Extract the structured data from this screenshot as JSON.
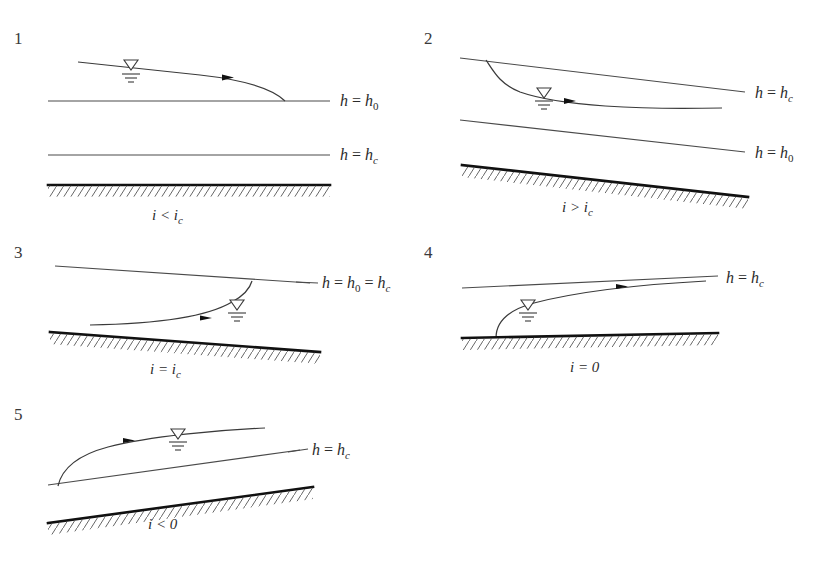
{
  "figure": {
    "background_color": "#ffffff",
    "line_color": "#3a3a3a",
    "bed_color": "#111111",
    "panel_count": 5
  },
  "symbols": {
    "water_level_marker": "water-level-triangle-icon",
    "flow_direction_marker": "flow-direction-arrow-icon",
    "bed_marker": "hatched-channel-bed"
  },
  "panels": [
    {
      "number": "1",
      "slope_condition": "i<i_c",
      "slope_label_parts": {
        "lead": "i",
        "op": "<",
        "sym": "i",
        "sub": "c"
      },
      "bed_type": "mild-slope",
      "labels": [
        {
          "id": "h0",
          "text": "h = h_0",
          "parts": {
            "lhs": "h",
            "op": "=",
            "rhs": "h",
            "sub": "0",
            "sub_kind": "num"
          }
        },
        {
          "id": "hc",
          "text": "h = h_c",
          "parts": {
            "lhs": "h",
            "op": "=",
            "rhs": "h",
            "sub": "c",
            "sub_kind": "italic"
          }
        }
      ],
      "description": "Mild slope, drawdown curve falling to normal depth line"
    },
    {
      "number": "2",
      "slope_condition": "i>i_c",
      "slope_label_parts": {
        "lead": "i",
        "op": ">",
        "sym": "i",
        "sub": "c"
      },
      "bed_type": "steep-slope",
      "labels": [
        {
          "id": "hc",
          "text": "h = h_c",
          "parts": {
            "lhs": "h",
            "op": "=",
            "rhs": "h",
            "sub": "c",
            "sub_kind": "italic"
          }
        },
        {
          "id": "h0",
          "text": "h = h_0",
          "parts": {
            "lhs": "h",
            "op": "=",
            "rhs": "h",
            "sub": "0",
            "sub_kind": "num"
          }
        }
      ],
      "description": "Steep slope, profile descending from critical depth line"
    },
    {
      "number": "3",
      "slope_condition": "i=i_c",
      "slope_label_parts": {
        "lead": "i",
        "op": "=",
        "sym": "i",
        "sub": "c"
      },
      "bed_type": "critical-slope",
      "labels": [
        {
          "id": "h0hc",
          "text": "h = h_0 = h_c",
          "parts": {
            "lhs": "h",
            "op": "=",
            "mid": "h",
            "mid_sub": "0",
            "op2": "=",
            "rhs": "h",
            "sub": "c",
            "sub_kind": "italic"
          }
        }
      ],
      "description": "Critical slope, normal depth equals critical depth"
    },
    {
      "number": "4",
      "slope_condition": "i=0",
      "slope_label_parts": {
        "lead": "i",
        "op": "=",
        "sym": "0",
        "sub": ""
      },
      "bed_type": "horizontal-bed",
      "labels": [
        {
          "id": "hc",
          "text": "h = h_c",
          "parts": {
            "lhs": "h",
            "op": "=",
            "rhs": "h",
            "sub": "c",
            "sub_kind": "italic"
          }
        }
      ],
      "description": "Horizontal bed, rising backwater curve below critical depth line"
    },
    {
      "number": "5",
      "slope_condition": "i<0",
      "slope_label_parts": {
        "lead": "i",
        "op": "<",
        "sym": "0",
        "sub": ""
      },
      "bed_type": "adverse-slope",
      "labels": [
        {
          "id": "hc",
          "text": "h = h_c",
          "parts": {
            "lhs": "h",
            "op": "=",
            "rhs": "h",
            "sub": "c",
            "sub_kind": "italic"
          }
        }
      ],
      "description": "Adverse slope, rising backwater curve"
    }
  ]
}
